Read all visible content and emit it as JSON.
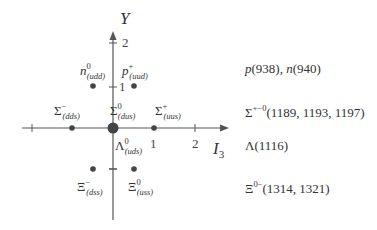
{
  "diagram": {
    "axes": {
      "x_label": "I",
      "x_label_sub": "3",
      "y_label": "Y",
      "x_ticks": [
        "1",
        "2"
      ],
      "y_ticks": [
        "2",
        "1"
      ]
    },
    "particles": [
      {
        "id": "n",
        "symbol": "n",
        "sup": "0",
        "quarks": "(udd)",
        "I3": -0.5,
        "Y": 1
      },
      {
        "id": "p",
        "symbol": "p",
        "sup": "+",
        "quarks": "(uud)",
        "I3": 0.5,
        "Y": 1
      },
      {
        "id": "sigma-minus",
        "symbol": "Σ",
        "sup": "−",
        "quarks": "(dds)",
        "I3": -1,
        "Y": 0
      },
      {
        "id": "sigma-zero",
        "symbol": "Σ",
        "sup": "0",
        "quarks": "(dus)",
        "I3": 0,
        "Y": 0
      },
      {
        "id": "sigma-plus",
        "symbol": "Σ",
        "sup": "+",
        "quarks": "(uus)",
        "I3": 1,
        "Y": 0
      },
      {
        "id": "lambda",
        "symbol": "Λ",
        "sup": "0",
        "quarks": "(uds)",
        "I3": 0,
        "Y": 0
      },
      {
        "id": "xi-minus",
        "symbol": "Ξ",
        "sup": "−",
        "quarks": "(dss)",
        "I3": -0.5,
        "Y": -1
      },
      {
        "id": "xi-zero",
        "symbol": "Ξ",
        "sup": "0",
        "quarks": "(uss)",
        "I3": 0.5,
        "Y": -1
      }
    ],
    "masses": {
      "nucleon": {
        "p": "p",
        "p_val": "(938), ",
        "n": "n",
        "n_val": "(940)"
      },
      "sigma": {
        "symbol": "Σ",
        "sup": "+−0",
        "values": "(1189, 1193, 1197)"
      },
      "lambda": {
        "symbol": "Λ",
        "values": "(1116)"
      },
      "xi": {
        "symbol": "Ξ",
        "sup": "0−",
        "values": "(1314, 1321)"
      }
    },
    "colors": {
      "axis": "#555555",
      "dot": "#444444"
    }
  }
}
